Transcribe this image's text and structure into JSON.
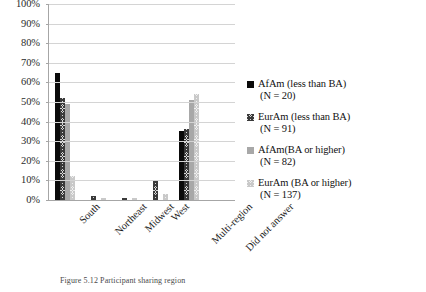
{
  "chart_data": {
    "type": "bar",
    "title": "",
    "xlabel": "",
    "ylabel": "",
    "ylim": [
      0,
      100
    ],
    "grid": true,
    "legend_position": "right",
    "categories": [
      "South",
      "Northeast",
      "Midwest",
      "West",
      "Multi-region",
      "Did not answer"
    ],
    "tick_labels": [
      "0%",
      "10%",
      "20%",
      "30%",
      "40%",
      "50%",
      "60%",
      "70%",
      "80%",
      "90%",
      "100%"
    ],
    "series": [
      {
        "name": "AfAm (less than BA)",
        "n_label": "(N = 20)",
        "color": "#0a0a0a",
        "values": [
          65,
          0,
          0,
          0,
          35,
          0
        ]
      },
      {
        "name": "EurAm (less than BA)",
        "n_label": "(N = 91)",
        "color": "#3a3a3a",
        "values": [
          52,
          2,
          1,
          10,
          36,
          0
        ]
      },
      {
        "name": "AfAm(BA or higher)",
        "n_label": "(N = 82)",
        "color": "#a8a8a8",
        "values": [
          49,
          0,
          0,
          0,
          51,
          0
        ]
      },
      {
        "name": "EurAm (BA or higher)",
        "n_label": "(N = 137)",
        "color": "#d8d8d8",
        "values": [
          12,
          1,
          1,
          3,
          54,
          0
        ]
      }
    ]
  },
  "caption": {
    "text": "Figure 5.12 Participant sharing region"
  }
}
